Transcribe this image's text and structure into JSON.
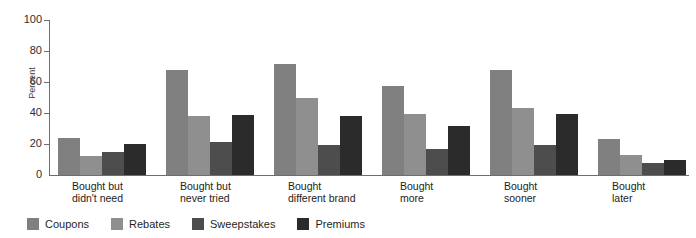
{
  "chart_data": {
    "type": "bar",
    "title": "",
    "xlabel": "",
    "ylabel": "Percent",
    "ylim": [
      0,
      100
    ],
    "yticks": [
      0,
      20,
      40,
      60,
      80,
      100
    ],
    "ytick_labels": [
      "0",
      "20",
      "40",
      "60",
      "80",
      "100"
    ],
    "grid": false,
    "legend_position": "bottom-left",
    "categories": [
      "Bought but\ndidn't need",
      "Bought but\nnever tried",
      "Bought\ndifferent brand",
      "Bought\nmore",
      "Bought\nsooner",
      "Bought\nlater"
    ],
    "series": [
      {
        "name": "Coupons",
        "color": "#808080",
        "values": [
          24,
          68,
          71.5,
          57.5,
          68,
          23
        ]
      },
      {
        "name": "Rebates",
        "color": "#8f8f8f",
        "values": [
          12.5,
          38,
          50,
          39.5,
          43,
          13
        ]
      },
      {
        "name": "Sweepstakes",
        "color": "#4d4d4d",
        "values": [
          15,
          21,
          19.5,
          17,
          19.5,
          8
        ]
      },
      {
        "name": "Premiums",
        "color": "#2b2b2b",
        "values": [
          20,
          38.5,
          38,
          31.5,
          39.5,
          9.5
        ]
      }
    ]
  },
  "axis": {
    "y_title": "Percent",
    "tick_color": "#6e6e6e",
    "axis_color": "#6e6e6e"
  }
}
